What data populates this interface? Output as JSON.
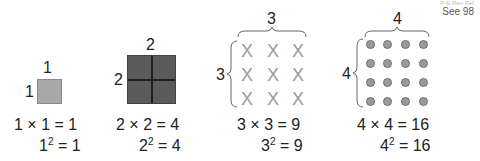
{
  "corner_note": {
    "cut_text": "P-E Ren Ref",
    "see_ref": "See 98"
  },
  "figures": [
    {
      "id": "one",
      "top_label": "1",
      "side_label": "1",
      "representation": "shaded-square",
      "equation": {
        "lhs": "1 × 1",
        "rhs": "= 1"
      },
      "square": {
        "base": "1",
        "exp": "2",
        "rhs": "= 1"
      }
    },
    {
      "id": "two",
      "top_label": "2",
      "side_label": "2",
      "representation": "2x2-grid-square",
      "equation": {
        "lhs": "2 × 2",
        "rhs": "= 4"
      },
      "square": {
        "base": "2",
        "exp": "2",
        "rhs": "= 4"
      }
    },
    {
      "id": "three",
      "top_label": "3",
      "side_label": "3",
      "representation": "3x3-array-of-x",
      "mark": "X",
      "equation": {
        "lhs": "3 × 3",
        "rhs": "= 9"
      },
      "square": {
        "base": "3",
        "exp": "2",
        "rhs": "= 9"
      }
    },
    {
      "id": "four",
      "top_label": "4",
      "side_label": "4",
      "representation": "4x4-array-of-dots",
      "equation": {
        "lhs": "4 × 4",
        "rhs": "= 16"
      },
      "square": {
        "base": "4",
        "exp": "2",
        "rhs": "= 16"
      }
    }
  ],
  "colors": {
    "square1_fill": "#a9a9a9",
    "square2_fill": "#5b5b5b",
    "x_mark": "#9a9a9a",
    "dot_fill": "#9a9a9a"
  }
}
